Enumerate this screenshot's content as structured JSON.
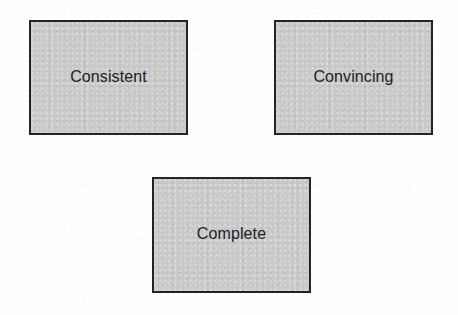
{
  "diagram": {
    "type": "block-diagram",
    "title": "",
    "canvas": {
      "width": 458,
      "height": 315,
      "background": "#fefefe"
    },
    "style": {
      "node_fill": "#c9c9c9",
      "node_border": "#242424",
      "node_border_width": 2,
      "text_color": "#1c1c1c",
      "font_size": 16
    },
    "nodes": [
      {
        "id": "consistent",
        "label": "Consistent",
        "shape": "rectangle",
        "x": 29,
        "y": 20,
        "width": 159,
        "height": 115
      },
      {
        "id": "convincing",
        "label": "Convincing",
        "shape": "rectangle",
        "x": 274,
        "y": 20,
        "width": 159,
        "height": 115
      },
      {
        "id": "complete",
        "label": "Complete",
        "shape": "rectangle",
        "x": 152,
        "y": 177,
        "width": 159,
        "height": 116
      }
    ],
    "edges": []
  }
}
